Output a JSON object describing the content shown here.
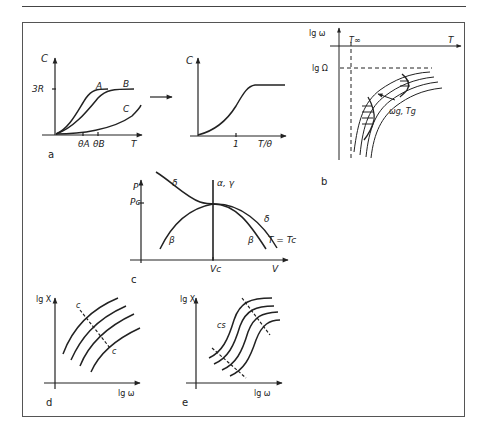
{
  "figure": {
    "panels": {
      "a": {
        "label": "a",
        "left": {
          "y_axis": "C",
          "x_axis": "T",
          "y_tick": "3R",
          "curves": [
            "A",
            "B",
            "C"
          ],
          "x_ticks": [
            "θA",
            "θB"
          ]
        },
        "right": {
          "y_axis": "C",
          "x_axis": "T/θ",
          "x_tick": "1"
        }
      },
      "b": {
        "label": "b",
        "y_axis": "lg ω",
        "x_axis": "T",
        "x_marker": "T∞",
        "y_marker": "lg Ω",
        "annotation": "ωg, Tg"
      },
      "c": {
        "label": "c",
        "y_axis": "P",
        "x_axis": "V",
        "y_tick": "Pc",
        "x_tick": "Vc",
        "curve_labels": {
          "delta_left": "δ",
          "delta_right": "δ",
          "beta_left": "β",
          "beta_right": "β",
          "vertical": "α, γ",
          "isotherm": "T = Tc"
        }
      },
      "d": {
        "label": "d",
        "y_axis": "lg X",
        "x_axis": "lg ω",
        "line_label_top": "c",
        "line_label_bottom": "c"
      },
      "e": {
        "label": "e",
        "y_axis": "lg X",
        "x_axis": "lg ω",
        "line_label": "cs"
      }
    }
  }
}
